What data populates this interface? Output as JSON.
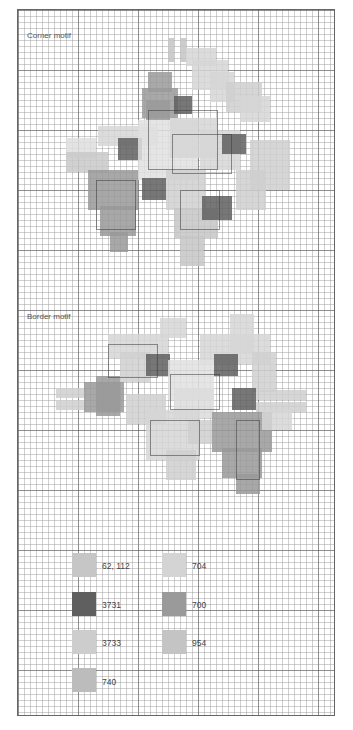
{
  "chart": {
    "grid": {
      "cell_px": 6,
      "major_every": 10
    },
    "titles": {
      "corner": "Corner motif",
      "border": "Border motif"
    }
  },
  "colors": {
    "62,112": "#c9c9c9",
    "3731": "#6a6a6a",
    "3733": "#cfcfcf",
    "740": "#bdbdbd",
    "704": "#d6d6d6",
    "700": "#999999",
    "954": "#c3c3c3",
    "light": "#dedede"
  },
  "legend": [
    {
      "code": "62, 112",
      "color": "#c6c6c6",
      "x": 72,
      "y": 553,
      "lx": 102,
      "ly": 561
    },
    {
      "code": "3731",
      "color": "#5f5f5f",
      "x": 72,
      "y": 592,
      "lx": 102,
      "ly": 600
    },
    {
      "code": "3733",
      "color": "#cdcdcd",
      "x": 72,
      "y": 630,
      "lx": 102,
      "ly": 638
    },
    {
      "code": "740",
      "color": "#bcbcbc",
      "x": 72,
      "y": 668,
      "lx": 102,
      "ly": 677
    },
    {
      "code": "704",
      "color": "#d4d4d4",
      "x": 162,
      "y": 553,
      "lx": 192,
      "ly": 561
    },
    {
      "code": "700",
      "color": "#9a9a9a",
      "x": 162,
      "y": 592,
      "lx": 192,
      "ly": 600
    },
    {
      "code": "954",
      "color": "#c4c4c4",
      "x": 162,
      "y": 630,
      "lx": 192,
      "ly": 638
    }
  ],
  "corner_motif_cells": [
    [
      168,
      38,
      6,
      24,
      "#c4c4c4"
    ],
    [
      180,
      38,
      6,
      24,
      "#c4c4c4"
    ],
    [
      186,
      48,
      30,
      18,
      "#d6d6d6"
    ],
    [
      192,
      60,
      36,
      30,
      "#d6d6d6"
    ],
    [
      210,
      72,
      24,
      30,
      "#d6d6d6"
    ],
    [
      226,
      82,
      36,
      30,
      "#cfcfcf"
    ],
    [
      240,
      96,
      30,
      26,
      "#d6d6d6"
    ],
    [
      148,
      72,
      24,
      20,
      "#9a9a9a"
    ],
    [
      142,
      88,
      36,
      30,
      "#9a9a9a"
    ],
    [
      146,
      100,
      24,
      20,
      "#9a9a9a"
    ],
    [
      174,
      96,
      18,
      18,
      "#5f5f5f"
    ],
    [
      98,
      126,
      60,
      20,
      "#d6d6d6"
    ],
    [
      66,
      138,
      30,
      20,
      "#dedede"
    ],
    [
      66,
      152,
      42,
      20,
      "#c9c9c9"
    ],
    [
      118,
      138,
      24,
      22,
      "#5f5f5f"
    ],
    [
      138,
      120,
      60,
      60,
      "#e1e1e1"
    ],
    [
      170,
      118,
      48,
      40,
      "#d6d6d6"
    ],
    [
      200,
      130,
      40,
      40,
      "#d6d6d6"
    ],
    [
      222,
      134,
      24,
      20,
      "#5f5f5f"
    ],
    [
      250,
      140,
      40,
      50,
      "#cfcfcf"
    ],
    [
      236,
      170,
      30,
      40,
      "#cfcfcf"
    ],
    [
      88,
      170,
      50,
      40,
      "#999999"
    ],
    [
      100,
      206,
      36,
      30,
      "#999999"
    ],
    [
      110,
      232,
      18,
      20,
      "#999999"
    ],
    [
      142,
      178,
      24,
      22,
      "#5f5f5f"
    ],
    [
      166,
      170,
      40,
      40,
      "#d0d0d0"
    ],
    [
      174,
      208,
      44,
      30,
      "#c6c6c6"
    ],
    [
      180,
      236,
      24,
      30,
      "#c6c6c6"
    ],
    [
      202,
      196,
      30,
      24,
      "#5f5f5f"
    ]
  ],
  "border_motif_cells": [
    [
      160,
      318,
      26,
      20,
      "#d6d6d6"
    ],
    [
      108,
      334,
      60,
      24,
      "#d6d6d6"
    ],
    [
      120,
      352,
      30,
      30,
      "#d0d0d0"
    ],
    [
      230,
      314,
      24,
      40,
      "#d6d6d6"
    ],
    [
      200,
      334,
      70,
      30,
      "#d6d6d6"
    ],
    [
      252,
      352,
      24,
      40,
      "#d0d0d0"
    ],
    [
      146,
      354,
      24,
      22,
      "#5f5f5f"
    ],
    [
      214,
      354,
      24,
      22,
      "#5f5f5f"
    ],
    [
      168,
      360,
      46,
      40,
      "#e1e1e1"
    ],
    [
      174,
      388,
      40,
      30,
      "#dcdcdc"
    ],
    [
      232,
      388,
      24,
      22,
      "#5f5f5f"
    ],
    [
      56,
      388,
      30,
      10,
      "#cfcfcf"
    ],
    [
      56,
      400,
      30,
      10,
      "#cfcfcf"
    ],
    [
      84,
      382,
      40,
      30,
      "#999999"
    ],
    [
      96,
      376,
      24,
      40,
      "#999999"
    ],
    [
      256,
      390,
      50,
      10,
      "#cfcfcf"
    ],
    [
      256,
      402,
      50,
      10,
      "#cfcfcf"
    ],
    [
      126,
      394,
      40,
      30,
      "#d0d0d0"
    ],
    [
      146,
      410,
      54,
      50,
      "#d6d6d6"
    ],
    [
      166,
      450,
      30,
      30,
      "#cfcfcf"
    ],
    [
      188,
      420,
      24,
      24,
      "#cfcfcf"
    ],
    [
      212,
      412,
      60,
      40,
      "#999999"
    ],
    [
      222,
      448,
      40,
      30,
      "#999999"
    ],
    [
      236,
      474,
      24,
      20,
      "#999999"
    ],
    [
      262,
      410,
      30,
      20,
      "#d6d6d6"
    ]
  ],
  "outlines": [
    [
      148,
      110,
      70,
      60
    ],
    [
      172,
      134,
      60,
      40
    ],
    [
      96,
      180,
      40,
      50
    ],
    [
      180,
      190,
      40,
      40
    ],
    [
      108,
      344,
      50,
      34
    ],
    [
      170,
      374,
      50,
      36
    ],
    [
      150,
      420,
      50,
      36
    ],
    [
      236,
      420,
      24,
      60
    ]
  ]
}
